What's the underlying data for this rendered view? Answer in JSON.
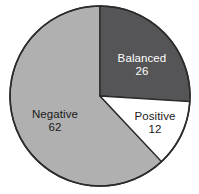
{
  "chart_data": {
    "type": "pie",
    "title": "",
    "subtitle": "",
    "xlabel": "",
    "ylabel": "",
    "legend_position": "none",
    "grid": false,
    "total": 100,
    "start_angle_deg": 0,
    "direction": "clockwise",
    "categories": [
      "Balanced",
      "Positive",
      "Negative"
    ],
    "values": [
      26,
      12,
      62
    ],
    "slices": [
      {
        "label": "Balanced",
        "value": "26",
        "value_number": 26,
        "percent": 26,
        "start_deg": 0,
        "end_deg": 93.6,
        "fill": "#555558",
        "text_color": "#ffffff"
      },
      {
        "label": "Positive",
        "value": "12",
        "value_number": 12,
        "percent": 12,
        "start_deg": 93.6,
        "end_deg": 136.8,
        "fill": "#ffffff",
        "text_color": "#1a1a1a"
      },
      {
        "label": "Negative",
        "value": "62",
        "value_number": 62,
        "percent": 62,
        "start_deg": 136.8,
        "end_deg": 360,
        "fill": "#b0b0b0",
        "text_color": "#1a1a1a"
      }
    ]
  },
  "figure": {
    "background": "#ffffff",
    "outline_color": "#2b2b2b",
    "center_x": 100,
    "center_y": 96,
    "radius": 90
  }
}
